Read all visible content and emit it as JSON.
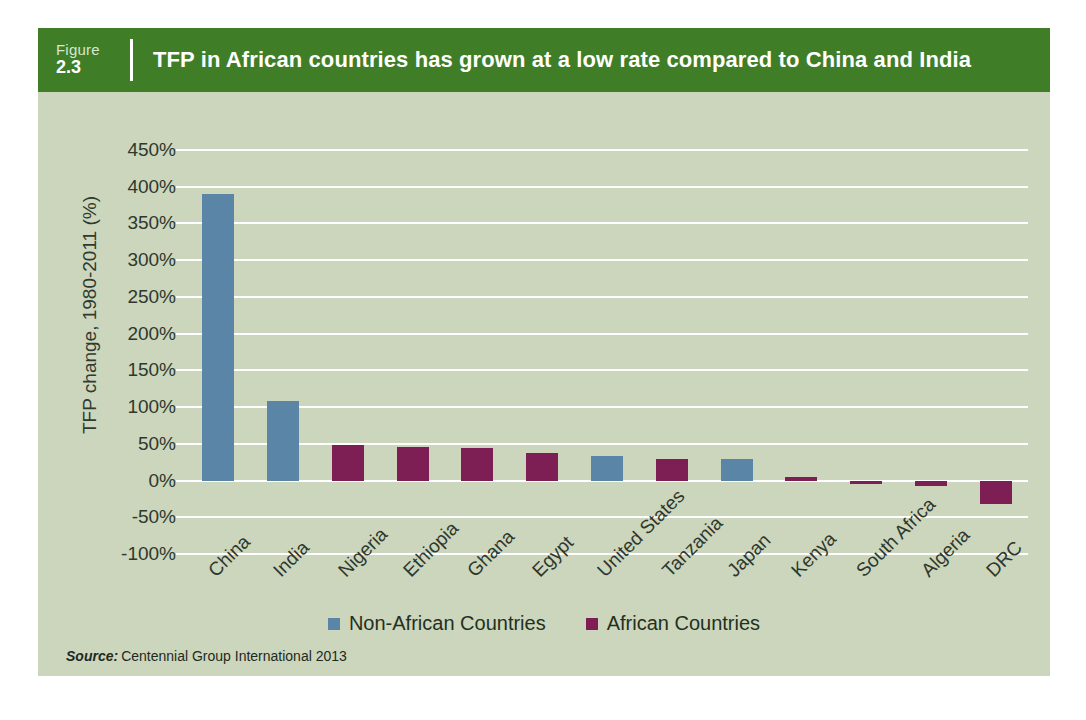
{
  "header": {
    "figure_word": "Figure",
    "figure_number": "2.3",
    "title": "TFP in African countries has grown at a low rate compared to China and India"
  },
  "source": {
    "label": "Source:",
    "text": "Centennial Group International 2013"
  },
  "colors": {
    "header_green": "#3f7d27",
    "plot_background": "#ccd6bc",
    "gridline": "#ffffff",
    "non_african": "#5b85a7",
    "african": "#7d1f54",
    "text": "#2e382e"
  },
  "chart_data": {
    "type": "bar",
    "title": "TFP in African countries has grown at a low rate compared to China and India",
    "xlabel": "",
    "ylabel": "TFP change, 1980-2011 (%)",
    "ylim": [
      -100,
      450
    ],
    "ytick_labels": [
      "450%",
      "400%",
      "350%",
      "300%",
      "250%",
      "200%",
      "150%",
      "100%",
      "50%",
      "0%",
      "-50%",
      "-100%"
    ],
    "ytick_values": [
      450,
      400,
      350,
      300,
      250,
      200,
      150,
      100,
      50,
      0,
      -50,
      -100
    ],
    "grid": true,
    "legend_position": "bottom-center",
    "categories": [
      "China",
      "India",
      "Nigeria",
      "Ethiopia",
      "Ghana",
      "Egypt",
      "United States",
      "Tanzania",
      "Japan",
      "Kenya",
      "South Africa",
      "Algeria",
      "DRC"
    ],
    "values": [
      390,
      108,
      48,
      45,
      44,
      37,
      34,
      29,
      29,
      5,
      -2,
      -8,
      -32
    ],
    "groups": [
      "non_african",
      "non_african",
      "african",
      "african",
      "african",
      "african",
      "non_african",
      "african",
      "non_african",
      "african",
      "african",
      "african",
      "african"
    ],
    "series": [
      {
        "name": "Non-African Countries",
        "color": "#5b85a7",
        "points": [
          {
            "category": "China",
            "value": 390
          },
          {
            "category": "India",
            "value": 108
          },
          {
            "category": "United States",
            "value": 34
          },
          {
            "category": "Japan",
            "value": 29
          }
        ]
      },
      {
        "name": "African Countries",
        "color": "#7d1f54",
        "points": [
          {
            "category": "Nigeria",
            "value": 48
          },
          {
            "category": "Ethiopia",
            "value": 45
          },
          {
            "category": "Ghana",
            "value": 44
          },
          {
            "category": "Egypt",
            "value": 37
          },
          {
            "category": "Tanzania",
            "value": 29
          },
          {
            "category": "Kenya",
            "value": 5
          },
          {
            "category": "South Africa",
            "value": -2
          },
          {
            "category": "Algeria",
            "value": -8
          },
          {
            "category": "DRC",
            "value": -32
          }
        ]
      }
    ],
    "legend": [
      {
        "label": "Non-African Countries",
        "color": "#5b85a7",
        "key": "non_african"
      },
      {
        "label": "African Countries",
        "color": "#7d1f54",
        "key": "african"
      }
    ]
  }
}
